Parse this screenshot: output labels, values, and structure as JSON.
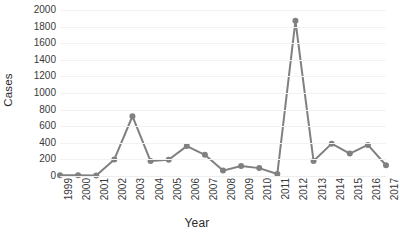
{
  "chart_data": {
    "type": "line",
    "title": "",
    "xlabel": "Year",
    "ylabel": "Cases",
    "grid": true,
    "legend": "none",
    "line_color": "#808080",
    "marker_color": "#808080",
    "gridline_color": "#f2f2f2",
    "ylim": [
      0,
      2000
    ],
    "ytick_step": 200,
    "yticks": [
      "2000",
      "1800",
      "1600",
      "1400",
      "1200",
      "1000",
      "800",
      "600",
      "400",
      "200",
      "0"
    ],
    "categories": [
      "1999",
      "2000",
      "2001",
      "2002",
      "2003",
      "2004",
      "2005",
      "2006",
      "2007",
      "2008",
      "2009",
      "2010",
      "2011",
      "2012",
      "2013",
      "2014",
      "2015",
      "2016",
      "2017"
    ],
    "values": [
      8,
      8,
      5,
      200,
      720,
      180,
      195,
      360,
      255,
      65,
      120,
      95,
      25,
      1870,
      180,
      390,
      270,
      375,
      130
    ]
  }
}
